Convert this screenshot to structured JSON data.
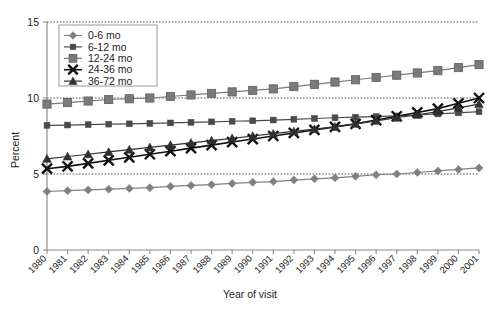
{
  "chart_data": {
    "type": "line",
    "title": "",
    "xlabel": "Year of visit",
    "ylabel": "Percent",
    "ylim": [
      0,
      15
    ],
    "yticks": [
      0,
      5,
      10,
      15
    ],
    "grid": "horizontal-dotted",
    "legend_position": "top-left",
    "categories": [
      "1980",
      "1981",
      "1982",
      "1983",
      "1984",
      "1985",
      "1986",
      "1987",
      "1988",
      "1989",
      "1990",
      "1991",
      "1992",
      "1993",
      "1994",
      "1995",
      "1996",
      "1997",
      "1998",
      "1999",
      "2000",
      "2001"
    ],
    "series": [
      {
        "name": "0-6 mo",
        "marker": "diamond",
        "color": "#808080",
        "values": [
          3.85,
          3.9,
          3.95,
          4.0,
          4.05,
          4.1,
          4.18,
          4.25,
          4.3,
          4.38,
          4.45,
          4.5,
          4.6,
          4.68,
          4.75,
          4.85,
          4.95,
          5.0,
          5.1,
          5.2,
          5.3,
          5.4
        ]
      },
      {
        "name": "6-12 mo",
        "marker": "square-small",
        "color": "#4a4a4a",
        "values": [
          8.2,
          8.22,
          8.25,
          8.28,
          8.3,
          8.33,
          8.36,
          8.4,
          8.43,
          8.47,
          8.5,
          8.55,
          8.6,
          8.65,
          8.7,
          8.74,
          8.78,
          8.82,
          8.88,
          8.95,
          9.02,
          9.1
        ]
      },
      {
        "name": "12-24 mo",
        "marker": "square-large",
        "color": "#7a7a7a",
        "values": [
          9.6,
          9.7,
          9.8,
          9.9,
          9.95,
          10.0,
          10.1,
          10.2,
          10.3,
          10.4,
          10.5,
          10.6,
          10.75,
          10.9,
          11.05,
          11.2,
          11.35,
          11.5,
          11.65,
          11.8,
          12.0,
          12.2
        ]
      },
      {
        "name": "24-36 mo",
        "marker": "x",
        "color": "#111111",
        "values": [
          5.35,
          5.5,
          5.7,
          5.9,
          6.1,
          6.3,
          6.5,
          6.7,
          6.9,
          7.1,
          7.3,
          7.5,
          7.7,
          7.9,
          8.1,
          8.3,
          8.55,
          8.8,
          9.05,
          9.3,
          9.65,
          10.0
        ]
      },
      {
        "name": "36-72 mo",
        "marker": "triangle",
        "color": "#303030",
        "values": [
          6.0,
          6.15,
          6.3,
          6.45,
          6.6,
          6.75,
          6.9,
          7.05,
          7.2,
          7.35,
          7.5,
          7.65,
          7.8,
          7.95,
          8.1,
          8.3,
          8.5,
          8.7,
          8.9,
          9.1,
          9.35,
          9.6
        ]
      }
    ]
  },
  "legend": {
    "entries": [
      "0-6 mo",
      "6-12 mo",
      "12-24 mo",
      "24-36 mo",
      "36-72 mo"
    ]
  },
  "axes": {
    "y_labels": [
      "15",
      "10",
      "5",
      "0"
    ],
    "y_title": "Percent",
    "x_title": "Year of visit"
  }
}
